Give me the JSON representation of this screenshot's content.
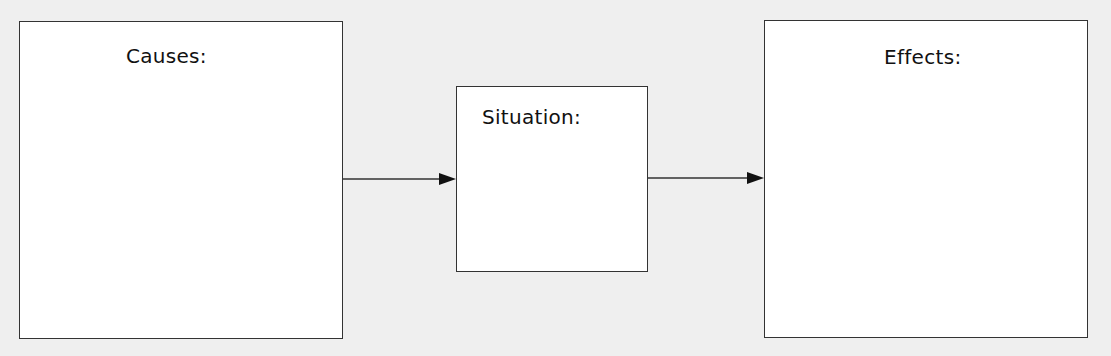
{
  "diagram": {
    "type": "cause-effect graphic organizer",
    "boxes": [
      {
        "id": "causes",
        "label": "Causes:"
      },
      {
        "id": "situation",
        "label": "Situation:"
      },
      {
        "id": "effects",
        "label": "Effects:"
      }
    ],
    "connections": [
      {
        "from": "causes",
        "to": "situation"
      },
      {
        "from": "situation",
        "to": "effects"
      }
    ],
    "colors": {
      "background": "#efefef",
      "box_fill": "#ffffff",
      "stroke": "#333333"
    }
  }
}
